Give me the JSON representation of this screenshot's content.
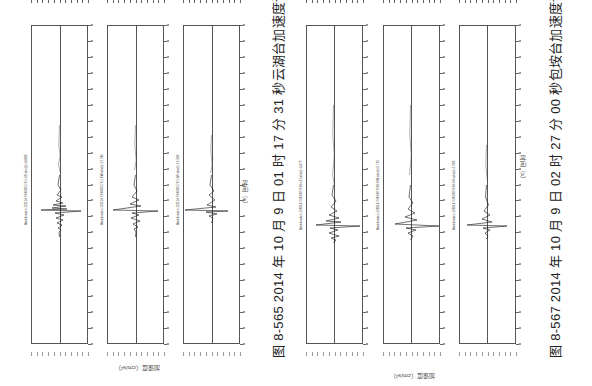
{
  "figures": [
    {
      "caption": "图 8-565   2014 年 10 月 9 日 01 时 17 分 31 秒云湖台加速度记录",
      "x_axis_label": "时间（s）",
      "y_axis_label": "加速度（cm/s²）",
      "panels": [
        {
          "annotation": "Acceleration 131114.9.0068117.01.UD abs(t)=14.883"
        },
        {
          "annotation": "Acceleration 131114.9.0068117.01.EW abs(t)=12.945"
        },
        {
          "annotation": "Acceleration 131114.9.0068117.01.NS abs(t)=16.330"
        }
      ]
    },
    {
      "caption": "图 8-567   2014 年 10 月 9 日 02 时 27 分 00 秒包垵台加速度记录",
      "x_axis_label": "时间（s）",
      "y_axis_label": "加速度（cm/s²）",
      "panels": [
        {
          "annotation": "Acceleration 128314.9.0068270.00.UD abs(t)=4.479"
        },
        {
          "annotation": "Acceleration 128314.9.0068270.00.EW abs(t)=6.762"
        },
        {
          "annotation": "Acceleration 128314.9.0068270.00.NS abs(t)=5.986"
        }
      ]
    }
  ],
  "chart_data": [
    {
      "type": "line",
      "title": "图 8-565 2014 年 10 月 9 日 01 时 17 分 31 秒云湖台加速度记录",
      "xlabel": "时间（s）",
      "ylabel": "加速度（cm/s²）",
      "orientation": "rotated 90°, time runs top to bottom",
      "time_ticks": 20,
      "series": [
        {
          "name": "UD",
          "peak_time_fraction": 0.54,
          "peak_abs": 14.883
        },
        {
          "name": "EW",
          "peak_time_fraction": 0.54,
          "peak_abs": 12.945
        },
        {
          "name": "NS",
          "peak_time_fraction": 0.54,
          "peak_abs": 16.33
        }
      ]
    },
    {
      "type": "line",
      "title": "图 8-567 2014 年 10 月 9 日 02 时 27 分 00 秒包垵台加速度记录",
      "xlabel": "时间（s）",
      "ylabel": "加速度（cm/s²）",
      "orientation": "rotated 90°, time runs top to bottom",
      "time_ticks": 20,
      "series": [
        {
          "name": "UD",
          "peak_time_fraction": 0.59,
          "peak_abs": 4.479
        },
        {
          "name": "EW",
          "peak_time_fraction": 0.59,
          "peak_abs": 6.762
        },
        {
          "name": "NS",
          "peak_time_fraction": 0.59,
          "peak_abs": 5.986
        }
      ]
    }
  ]
}
